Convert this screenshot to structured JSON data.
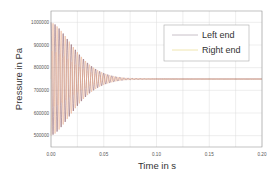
{
  "chart_data": {
    "type": "line",
    "title": "",
    "xlabel": "Time in s",
    "ylabel": "Pressure in Pa",
    "xlim": [
      0.0,
      0.2
    ],
    "ylim": [
      450000,
      1050000
    ],
    "x_ticks": [
      0.0,
      0.05,
      0.1,
      0.15,
      0.2
    ],
    "x_tick_labels": [
      "0.00",
      "0.05",
      "0.10",
      "0.15",
      "0.20"
    ],
    "x_minor_ticks": [
      0.025,
      0.075,
      0.125,
      0.175
    ],
    "y_ticks": [
      500000,
      600000,
      700000,
      800000,
      900000,
      1000000
    ],
    "y_tick_labels": [
      "500000",
      "600000",
      "700000",
      "800000",
      "900000",
      "1000000"
    ],
    "grid": true,
    "legend_position": "upper right",
    "series": [
      {
        "name": "Left end",
        "color": "#6b2f3f",
        "legend_color": "#c8c0c8",
        "description": "Damped oscillation starting at 1000000 Pa, decaying to ~750000 Pa by ~0.12 s",
        "initial_value": 1000000,
        "steady_state": 750000,
        "initial_amplitude": 250000,
        "settling_time": 0.12
      },
      {
        "name": "Right end",
        "color": "#e89a70",
        "legend_color": "#f0e6b0",
        "description": "Damped oscillation in anti-phase, starting near 500000 Pa, decaying to ~750000 Pa",
        "initial_value": 500000,
        "steady_state": 750000,
        "initial_amplitude": 250000,
        "settling_time": 0.12
      }
    ]
  },
  "legend": {
    "items": [
      {
        "label": "Left end"
      },
      {
        "label": "Right end"
      }
    ]
  }
}
